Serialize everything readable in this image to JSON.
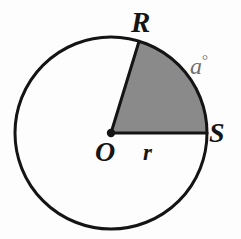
{
  "figure": {
    "name": "circle-with-shaded-sector",
    "background_color": "#fdfdfd",
    "stroke_color": "#141414",
    "sector_fill_color": "#8a8a8a",
    "angle_label_color": "#6f6f6f"
  },
  "circle": {
    "center_x": 111,
    "center_y": 133,
    "radius": 96,
    "stroke_width": 3
  },
  "points": {
    "center": {
      "label": "O",
      "x": 111,
      "y": 133
    },
    "upper": {
      "label": "R",
      "x": 139,
      "y": 41,
      "angle_deg": 73
    },
    "right": {
      "label": "S",
      "x": 207,
      "y": 133,
      "angle_deg": 0
    }
  },
  "labels": {
    "center_point": "O",
    "arc_start_point": "R",
    "arc_end_point": "S",
    "radius": "r",
    "angle": "a",
    "degree_symbol": "°"
  },
  "chart_data": {
    "type": "pie",
    "title": "",
    "categories": [
      "shaded sector ROS",
      "unshaded remainder"
    ],
    "values": [
      73,
      287
    ],
    "units": "degrees",
    "labels": [
      "a°",
      ""
    ],
    "colors": [
      "#8a8a8a",
      "#fdfdfd"
    ],
    "radius_label": "r",
    "center_label": "O",
    "boundary_point_labels": [
      "R",
      "S"
    ],
    "legend": "none",
    "grid": false
  }
}
